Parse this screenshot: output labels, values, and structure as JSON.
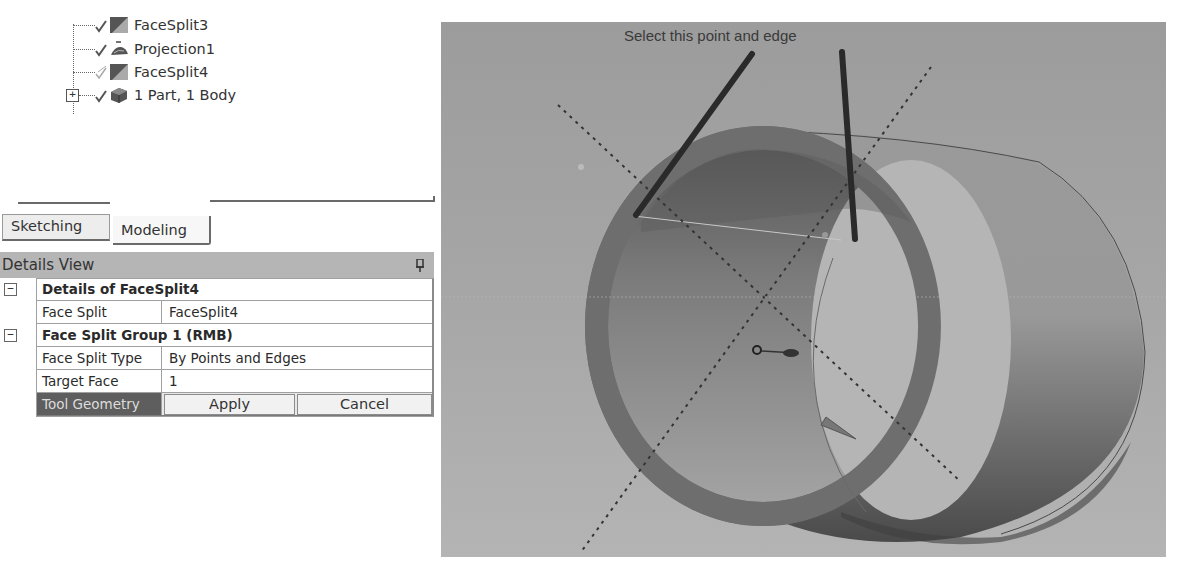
{
  "tree": {
    "items": [
      {
        "label": "FaceSplit3",
        "status": "check",
        "icon": "face-split-icon"
      },
      {
        "label": "Projection1",
        "status": "check",
        "icon": "projection-icon"
      },
      {
        "label": "FaceSplit4",
        "status": "pending-check",
        "icon": "face-split-icon"
      },
      {
        "label": "1 Part, 1 Body",
        "status": "check",
        "icon": "part-body-icon",
        "expandable": true,
        "expander": "+"
      }
    ]
  },
  "tabs": [
    {
      "label": "Sketching",
      "active": false
    },
    {
      "label": "Modeling",
      "active": true
    }
  ],
  "details": {
    "title": "Details View",
    "pin_icon": "pin-icon",
    "groups": [
      {
        "header": "Details of FaceSplit4",
        "collapse": "−",
        "rows": [
          {
            "label": "Face Split",
            "value": "FaceSplit4"
          }
        ]
      },
      {
        "header": "Face Split Group 1  (RMB)",
        "collapse": "−",
        "rows": [
          {
            "label": "Face Split Type",
            "value": "By Points and Edges"
          },
          {
            "label": "Target Face",
            "value": "1"
          }
        ]
      }
    ],
    "tool_geometry": {
      "label": "Tool Geometry",
      "apply_label": "Apply",
      "cancel_label": "Cancel"
    }
  },
  "viewport": {
    "annotation": "Select this point and edge",
    "background": "#a0a0a0"
  }
}
